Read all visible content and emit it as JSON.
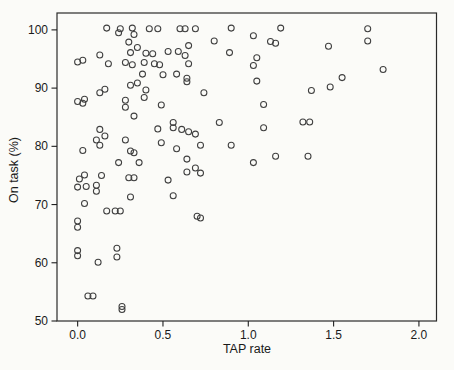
{
  "figure": {
    "background_color": "#fbfbf8",
    "axis_color": "#1a1a1a",
    "marker_color": "#3f3f3f",
    "marker_style": "open-circle"
  },
  "chart_data": {
    "type": "scatter",
    "title": "",
    "xlabel": "TAP rate",
    "ylabel": "On task (%)",
    "xlim": [
      -0.121,
      2.103
    ],
    "ylim": [
      50,
      102.9
    ],
    "x_ticks": [
      0.0,
      0.5,
      1.0,
      1.5,
      2.0
    ],
    "x_tick_labels": [
      "0.0",
      "0.5",
      "1.0",
      "1.5",
      "2.0"
    ],
    "y_ticks": [
      50,
      60,
      70,
      80,
      90,
      100
    ],
    "y_tick_labels": [
      "50",
      "60",
      "70",
      "80",
      "90",
      "100"
    ],
    "grid": false,
    "legend": null,
    "points": [
      [
        0.17,
        100.3
      ],
      [
        0.25,
        100.2
      ],
      [
        0.32,
        100.3
      ],
      [
        0.42,
        100.2
      ],
      [
        0.47,
        100.2
      ],
      [
        0.6,
        100.2
      ],
      [
        0.63,
        100.2
      ],
      [
        0.69,
        100.2
      ],
      [
        0.9,
        100.3
      ],
      [
        1.19,
        100.3
      ],
      [
        1.7,
        100.2
      ],
      [
        0.24,
        99.5
      ],
      [
        0.33,
        99.2
      ],
      [
        1.03,
        99.0
      ],
      [
        0.3,
        97.9
      ],
      [
        0.35,
        97.0
      ],
      [
        0.8,
        98.1
      ],
      [
        1.13,
        98.0
      ],
      [
        1.16,
        97.7
      ],
      [
        1.47,
        97.2
      ],
      [
        1.7,
        98.1
      ],
      [
        0.65,
        97.3
      ],
      [
        0.31,
        96.1
      ],
      [
        0.4,
        96.0
      ],
      [
        0.44,
        95.9
      ],
      [
        0.53,
        96.3
      ],
      [
        0.59,
        96.3
      ],
      [
        0.63,
        95.6
      ],
      [
        0.13,
        95.7
      ],
      [
        0.89,
        96.1
      ],
      [
        1.05,
        95.2
      ],
      [
        0.28,
        94.4
      ],
      [
        0.32,
        94.0
      ],
      [
        0.39,
        94.4
      ],
      [
        0.45,
        94.2
      ],
      [
        0.48,
        94.0
      ],
      [
        0.65,
        94.2
      ],
      [
        0.0,
        94.5
      ],
      [
        0.03,
        94.8
      ],
      [
        0.18,
        94.2
      ],
      [
        1.03,
        93.9
      ],
      [
        0.38,
        92.4
      ],
      [
        0.5,
        92.3
      ],
      [
        0.58,
        92.4
      ],
      [
        0.64,
        91.7
      ],
      [
        0.64,
        91.1
      ],
      [
        1.05,
        91.2
      ],
      [
        1.55,
        91.8
      ],
      [
        1.79,
        93.2
      ],
      [
        1.48,
        90.2
      ],
      [
        1.37,
        89.6
      ],
      [
        0.35,
        90.9
      ],
      [
        0.31,
        90.5
      ],
      [
        0.4,
        89.7
      ],
      [
        0.39,
        88.4
      ],
      [
        0.13,
        89.2
      ],
      [
        0.16,
        89.8
      ],
      [
        0.74,
        89.2
      ],
      [
        0.28,
        87.9
      ],
      [
        0.28,
        86.7
      ],
      [
        0.49,
        87.1
      ],
      [
        0.0,
        87.7
      ],
      [
        0.03,
        87.4
      ],
      [
        0.04,
        88.1
      ],
      [
        1.09,
        87.2
      ],
      [
        0.33,
        85.2
      ],
      [
        0.56,
        84.1
      ],
      [
        0.56,
        83.2
      ],
      [
        0.61,
        82.9
      ],
      [
        0.83,
        84.1
      ],
      [
        1.32,
        84.2
      ],
      [
        1.36,
        84.2
      ],
      [
        1.09,
        83.2
      ],
      [
        0.13,
        82.9
      ],
      [
        0.16,
        81.8
      ],
      [
        0.11,
        81.1
      ],
      [
        0.13,
        80.2
      ],
      [
        0.03,
        79.3
      ],
      [
        0.28,
        81.1
      ],
      [
        0.47,
        83.0
      ],
      [
        0.49,
        80.6
      ],
      [
        0.58,
        79.6
      ],
      [
        0.65,
        82.5
      ],
      [
        0.69,
        82.1
      ],
      [
        0.72,
        80.2
      ],
      [
        0.9,
        80.2
      ],
      [
        0.31,
        79.2
      ],
      [
        0.33,
        78.9
      ],
      [
        0.36,
        77.2
      ],
      [
        0.24,
        77.2
      ],
      [
        1.16,
        78.3
      ],
      [
        1.35,
        78.3
      ],
      [
        1.03,
        77.2
      ],
      [
        0.64,
        77.8
      ],
      [
        0.64,
        75.6
      ],
      [
        0.69,
        76.3
      ],
      [
        0.72,
        75.4
      ],
      [
        0.04,
        75.1
      ],
      [
        0.01,
        74.4
      ],
      [
        0.14,
        75.0
      ],
      [
        0.3,
        74.6
      ],
      [
        0.33,
        74.6
      ],
      [
        0.53,
        74.2
      ],
      [
        0.0,
        73.0
      ],
      [
        0.05,
        73.1
      ],
      [
        0.11,
        73.3
      ],
      [
        0.11,
        72.3
      ],
      [
        0.31,
        71.3
      ],
      [
        0.56,
        71.5
      ],
      [
        0.04,
        70.2
      ],
      [
        0.17,
        68.9
      ],
      [
        0.22,
        68.9
      ],
      [
        0.25,
        68.9
      ],
      [
        0.7,
        68.0
      ],
      [
        0.72,
        67.7
      ],
      [
        0.0,
        67.2
      ],
      [
        0.0,
        66.1
      ],
      [
        0.23,
        62.5
      ],
      [
        0.23,
        61.0
      ],
      [
        0.0,
        62.1
      ],
      [
        0.0,
        61.2
      ],
      [
        0.12,
        60.1
      ],
      [
        0.06,
        54.3
      ],
      [
        0.09,
        54.3
      ],
      [
        0.26,
        52.5
      ],
      [
        0.26,
        52.0
      ]
    ]
  }
}
